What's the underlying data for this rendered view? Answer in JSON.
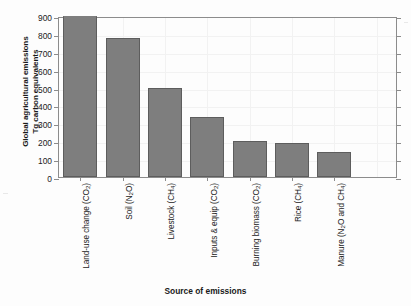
{
  "chart_data": {
    "type": "bar",
    "title": "",
    "xlabel": "Source of emissions",
    "ylabel": "Global agricultural emissions Tg carbon equivalents",
    "ylabel_line1": "Global agricultural emissions",
    "ylabel_line2": "Tg carbon equivalents",
    "categories": [
      "Land-use change (CO2)",
      "Soil (N2O)",
      "Livestock (CH4)",
      "Inputs & equip (CO2)",
      "Burning biomass (CO2)",
      "Rice (CH4)",
      "Manure (N2O and CH4)"
    ],
    "category_labels": [
      {
        "base": "Land-use change (CO",
        "sub": "2",
        "tail": ")"
      },
      {
        "base": "Soil (N",
        "sub": "2",
        "tail": "O)"
      },
      {
        "base": "Livestock (CH",
        "sub": "4",
        "tail": ")"
      },
      {
        "base": "Inputs & equip (CO",
        "sub": "2",
        "tail": ")"
      },
      {
        "base": "Burning biomass (CO",
        "sub": "2",
        "tail": ")"
      },
      {
        "base": "Rice (CH",
        "sub": "4",
        "tail": ")"
      },
      {
        "base": "Manure (N",
        "sub": "2",
        "tail": "O and CH",
        "sub2": "4",
        "tail2": ")"
      }
    ],
    "values": [
      900,
      775,
      500,
      333,
      202,
      190,
      140
    ],
    "ylim": [
      0,
      900
    ],
    "xlim_note": "7 categorical bars, extra blank slot at right",
    "yticks": [
      0,
      100,
      200,
      300,
      400,
      500,
      600,
      700,
      800,
      900
    ],
    "ytick_labels": [
      "0",
      "100",
      "200",
      "300",
      "400",
      "500",
      "600",
      "700",
      "800",
      "900"
    ],
    "grid": true,
    "legend": "none",
    "bar_color": "#7e7e7e",
    "bar_edge_color": "#5d5d5d",
    "axis_color": "#8c8c8c",
    "grid_color": "#f2f2f2",
    "background": "#fdfdfd"
  }
}
